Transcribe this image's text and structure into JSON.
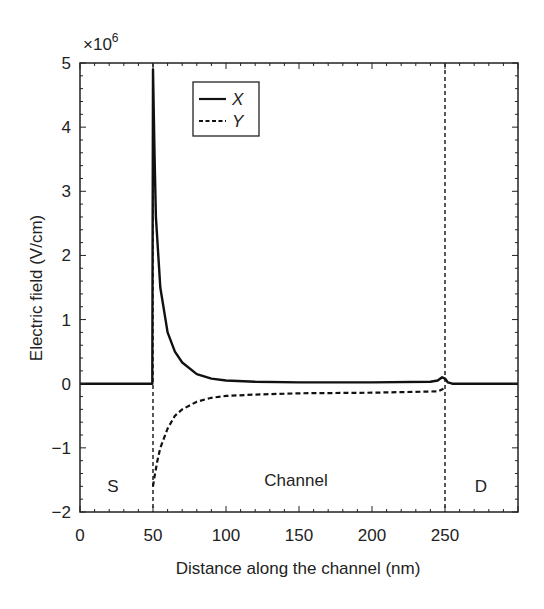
{
  "chart_data": {
    "type": "line",
    "title": "",
    "xlabel": "Distance along the channel (nm)",
    "ylabel": "Electric field (V/cm)",
    "y_multiplier": "×10",
    "y_multiplier_exp": "6",
    "xlim": [
      0,
      300
    ],
    "ylim": [
      -2,
      5
    ],
    "xticks": [
      0,
      50,
      100,
      150,
      200,
      250
    ],
    "xtick_labels": [
      "0",
      "50",
      "100",
      "150",
      "200",
      "250"
    ],
    "yticks": [
      -2,
      -1,
      0,
      1,
      2,
      3,
      4,
      5
    ],
    "ytick_labels": [
      "−2",
      "−1",
      "0",
      "1",
      "2",
      "3",
      "4",
      "5"
    ],
    "grid": false,
    "legend_position": "upper left (inside, near x=80)",
    "series": [
      {
        "name": "X",
        "style": "solid",
        "x": [
          0,
          49.5,
          50,
          51,
          52,
          55,
          60,
          65,
          70,
          80,
          90,
          100,
          120,
          150,
          200,
          240,
          245,
          248,
          250,
          252,
          255,
          300
        ],
        "y": [
          0,
          0,
          4.9,
          3.6,
          2.6,
          1.5,
          0.8,
          0.5,
          0.33,
          0.15,
          0.08,
          0.05,
          0.03,
          0.02,
          0.02,
          0.03,
          0.05,
          0.1,
          0.08,
          0.02,
          0,
          0
        ]
      },
      {
        "name": "Y",
        "style": "dashed",
        "x": [
          50,
          51,
          53,
          55,
          60,
          65,
          70,
          80,
          90,
          100,
          120,
          150,
          200,
          245,
          249
        ],
        "y": [
          -1.6,
          -1.45,
          -1.2,
          -1.0,
          -0.7,
          -0.5,
          -0.4,
          -0.28,
          -0.22,
          -0.19,
          -0.17,
          -0.15,
          -0.14,
          -0.12,
          -0.08
        ]
      }
    ],
    "vertical_dividers": [
      {
        "x": 50,
        "style": "dashed"
      },
      {
        "x": 250,
        "style": "dashed"
      }
    ],
    "annotations": [
      {
        "text": "S",
        "x": 25,
        "y": -1.6
      },
      {
        "text": "Channel",
        "x": 150,
        "y": -1.5
      },
      {
        "text": "D",
        "x": 275,
        "y": -1.6
      }
    ],
    "legend": [
      "X",
      "Y"
    ]
  }
}
